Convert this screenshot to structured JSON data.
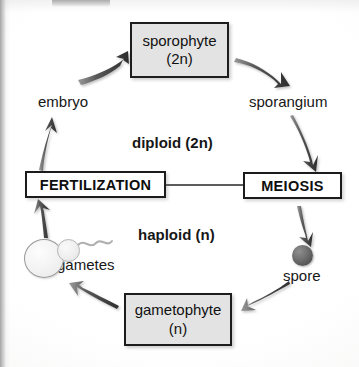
{
  "diagram": {
    "stages": [
      {
        "id": "sporophyte",
        "line1": "sporophyte",
        "line2": "(2n)"
      },
      {
        "id": "gametophyte",
        "line1": "gametophyte",
        "line2": "(n)"
      }
    ],
    "processes": [
      {
        "id": "fertilization",
        "label": "FERTILIZATION"
      },
      {
        "id": "meiosis",
        "label": "MEIOSIS"
      }
    ],
    "labels": {
      "embryo": "embryo",
      "sporangium": "sporangium",
      "diploid": "diploid (2n)",
      "haploid": "haploid (n)",
      "gametes": "gametes",
      "spore": "spore"
    },
    "cells": [
      {
        "id": "egg",
        "name": "egg-cell"
      },
      {
        "id": "sperm",
        "name": "sperm-cell"
      },
      {
        "id": "spore-body",
        "name": "spore-cell"
      }
    ],
    "arrows": [
      {
        "id": "embryo-to-sporophyte",
        "from": "embryo",
        "to": "sporophyte"
      },
      {
        "id": "sporophyte-to-sporangium",
        "from": "sporophyte",
        "to": "sporangium"
      },
      {
        "id": "sporangium-to-meiosis",
        "from": "sporangium",
        "to": "meiosis"
      },
      {
        "id": "meiosis-to-spore",
        "from": "meiosis",
        "to": "spore"
      },
      {
        "id": "spore-to-gametophyte",
        "from": "spore",
        "to": "gametophyte"
      },
      {
        "id": "gametophyte-to-gametes",
        "from": "gametophyte",
        "to": "gametes"
      },
      {
        "id": "gametes-to-fertilization",
        "from": "gametes",
        "to": "fertilization"
      },
      {
        "id": "fertilization-to-embryo",
        "from": "fertilization",
        "to": "embryo"
      }
    ],
    "connector": {
      "id": "fertilization-meiosis-connector"
    },
    "colors": {
      "stage_fill": "#e3e3e3",
      "process_fill": "#ffffff",
      "stroke": "#1d1d1d",
      "arrow": "#3a3a3a",
      "spore_fill": "#5a5a5a",
      "page": "#fbfbfa"
    }
  }
}
